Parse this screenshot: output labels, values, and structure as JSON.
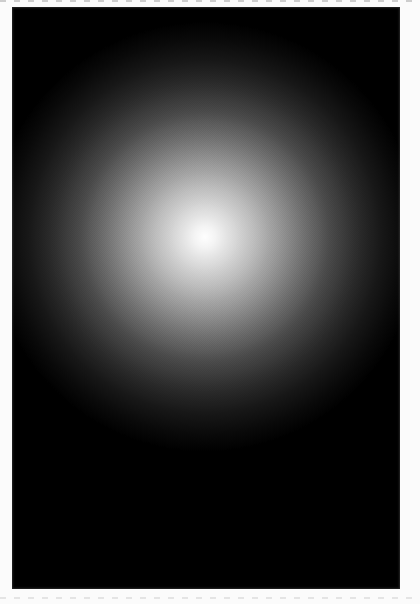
{
  "page": {
    "background_color": "#fbfbfb"
  },
  "plate": {
    "background_color": "#000000",
    "glow": {
      "center_x_pct": 49.7,
      "center_y_pct": 39.5,
      "radius_px": 215,
      "stops": [
        {
          "color": "#ffffff",
          "pos_pct": 0
        },
        {
          "color": "#f4f4f4",
          "pos_pct": 5
        },
        {
          "color": "#dedede",
          "pos_pct": 12
        },
        {
          "color": "#c0c0c0",
          "pos_pct": 22
        },
        {
          "color": "#9c9c9c",
          "pos_pct": 33
        },
        {
          "color": "#717171",
          "pos_pct": 46
        },
        {
          "color": "#4b4b4b",
          "pos_pct": 58
        },
        {
          "color": "#2e2e2e",
          "pos_pct": 70
        },
        {
          "color": "#171717",
          "pos_pct": 82
        },
        {
          "color": "#090909",
          "pos_pct": 92
        },
        {
          "color": "#000000",
          "pos_pct": 100
        }
      ]
    }
  }
}
